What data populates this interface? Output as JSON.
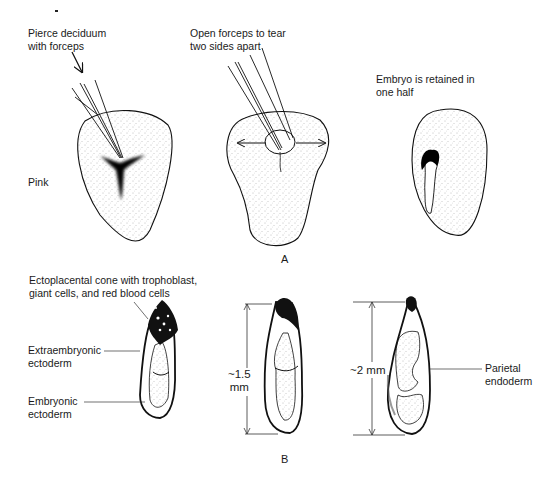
{
  "figure": {
    "panel_a": {
      "label": "A",
      "step1": {
        "caption_line1": "Pierce deciduum",
        "caption_line2": "with forceps",
        "side_label": "Pink"
      },
      "step2": {
        "caption_line1": "Open forceps to tear",
        "caption_line2": "two sides apart"
      },
      "step3": {
        "caption_line1": "Embryo is retained in",
        "caption_line2": "one half"
      }
    },
    "panel_b": {
      "label": "B",
      "labels": {
        "ectoplacental_line1": "Ectoplacental cone with trophoblast,",
        "ectoplacental_line2": "giant cells, and red blood cells",
        "extraembryonic_line1": "Extraembryonic",
        "extraembryonic_line2": "ectoderm",
        "embryonic_line1": "Embryonic",
        "embryonic_line2": "ectoderm",
        "parietal_line1": "Parietal",
        "parietal_line2": "endoderm"
      },
      "measurements": {
        "middle_line1": "~1.5",
        "middle_line2": "mm",
        "right": "~2 mm"
      }
    }
  }
}
